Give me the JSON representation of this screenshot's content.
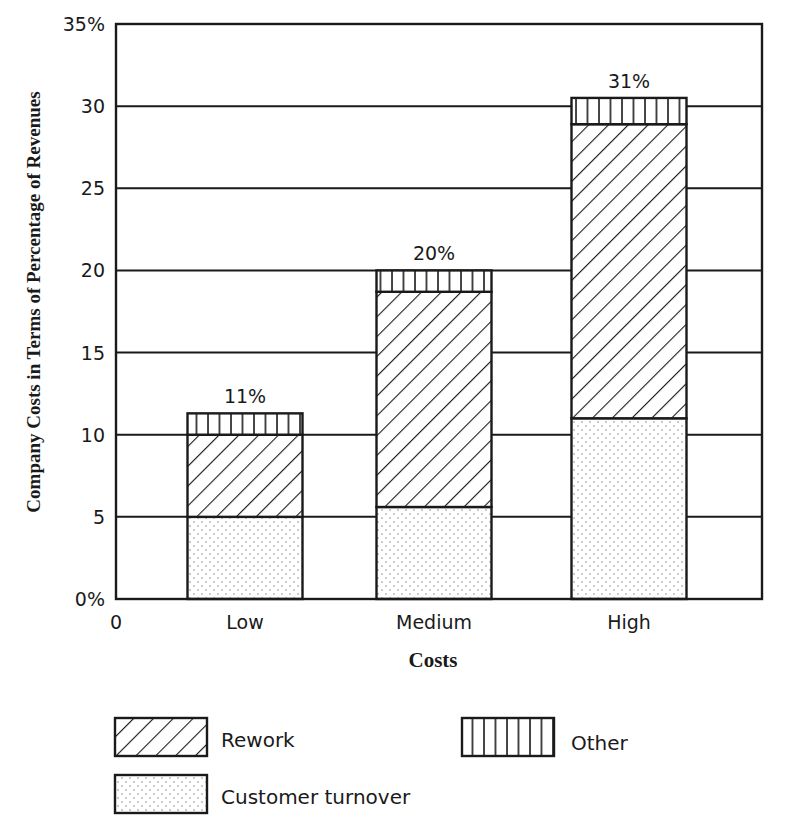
{
  "chart_data": {
    "type": "bar",
    "stacked": true,
    "title": "",
    "xlabel": "Costs",
    "ylabel": "Company Costs in Terms of Percentage of Revenues",
    "categories": [
      "Low",
      "Medium",
      "High"
    ],
    "x_origin_label": "0",
    "ylim": [
      0,
      35
    ],
    "yticks": [
      0,
      5,
      10,
      15,
      20,
      25,
      30,
      35
    ],
    "ytick_labels": [
      "0%",
      "5",
      "10",
      "15",
      "20",
      "25",
      "30",
      "35%"
    ],
    "grid": true,
    "series": [
      {
        "name": "Customer turnover",
        "pattern": "dots",
        "values": [
          5.0,
          5.6,
          11.0
        ]
      },
      {
        "name": "Rework",
        "pattern": "diagonal-hatch",
        "values": [
          5.0,
          13.1,
          17.9
        ]
      },
      {
        "name": "Other",
        "pattern": "vertical-lines",
        "values": [
          1.3,
          1.3,
          1.6
        ]
      }
    ],
    "total_labels": [
      "11%",
      "20%",
      "31%"
    ],
    "legend": {
      "placement": "bottom",
      "items": [
        {
          "name": "Rework",
          "pattern": "diagonal-hatch"
        },
        {
          "name": "Other",
          "pattern": "vertical-lines"
        },
        {
          "name": "Customer turnover",
          "pattern": "dots"
        }
      ]
    }
  }
}
